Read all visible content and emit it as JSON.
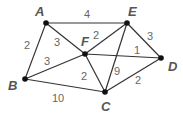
{
  "graph": {
    "nodes": [
      {
        "id": "A",
        "label": "A",
        "x": 46,
        "y": 23,
        "lx": 35,
        "ly": 16
      },
      {
        "id": "E",
        "label": "E",
        "x": 127,
        "y": 23,
        "lx": 128,
        "ly": 16
      },
      {
        "id": "F",
        "label": "F",
        "x": 85,
        "y": 54,
        "lx": 81,
        "ly": 46
      },
      {
        "id": "B",
        "label": "B",
        "x": 25,
        "y": 79,
        "lx": 8,
        "ly": 90
      },
      {
        "id": "D",
        "label": "D",
        "x": 161,
        "y": 58,
        "lx": 168,
        "ly": 71
      },
      {
        "id": "C",
        "label": "C",
        "x": 105,
        "y": 92,
        "lx": 101,
        "ly": 111
      }
    ],
    "edges": [
      {
        "from": "A",
        "to": "E",
        "weight": "4",
        "wx": 87,
        "wy": 18
      },
      {
        "from": "A",
        "to": "F",
        "weight": "3",
        "wx": 57,
        "wy": 46
      },
      {
        "from": "A",
        "to": "B",
        "weight": "2",
        "wx": 27,
        "wy": 49
      },
      {
        "from": "B",
        "to": "F",
        "weight": "3",
        "wx": 47,
        "wy": 65
      },
      {
        "from": "B",
        "to": "C",
        "weight": "10",
        "wx": 58,
        "wy": 102
      },
      {
        "from": "F",
        "to": "E",
        "weight": "2",
        "wx": 96,
        "wy": 39
      },
      {
        "from": "F",
        "to": "D",
        "weight": "1",
        "wx": 137,
        "wy": 54
      },
      {
        "from": "F",
        "to": "C",
        "weight": "2",
        "wx": 84,
        "wy": 80
      },
      {
        "from": "E",
        "to": "C",
        "weight": "9",
        "wx": 117,
        "wy": 75
      },
      {
        "from": "E",
        "to": "D",
        "weight": "3",
        "wx": 150,
        "wy": 40
      },
      {
        "from": "C",
        "to": "D",
        "weight": "2",
        "wx": 138,
        "wy": 84
      }
    ]
  }
}
